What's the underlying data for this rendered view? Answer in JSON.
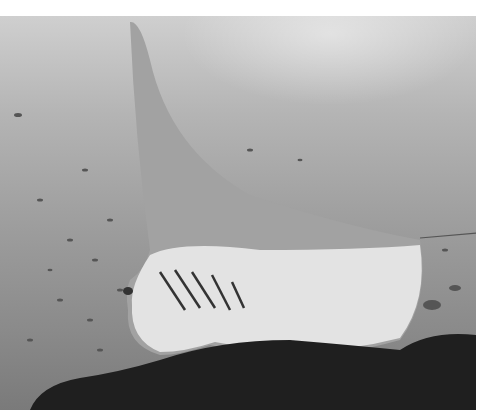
{
  "image": {
    "description": "Grayscale underwater photograph of a manta ray swimming over a coral reef with small fish in the background",
    "subjects": [
      "manta-ray",
      "coral-reef",
      "school-of-fish",
      "water-surface-light"
    ],
    "palette": {
      "water_light": "#cfcfcf",
      "water_dark": "#7a7a7a",
      "manta_top": "#9a9a9a",
      "manta_belly": "#e8e8e8",
      "reef": "#1e1e1e",
      "border": "#ffffff"
    }
  }
}
